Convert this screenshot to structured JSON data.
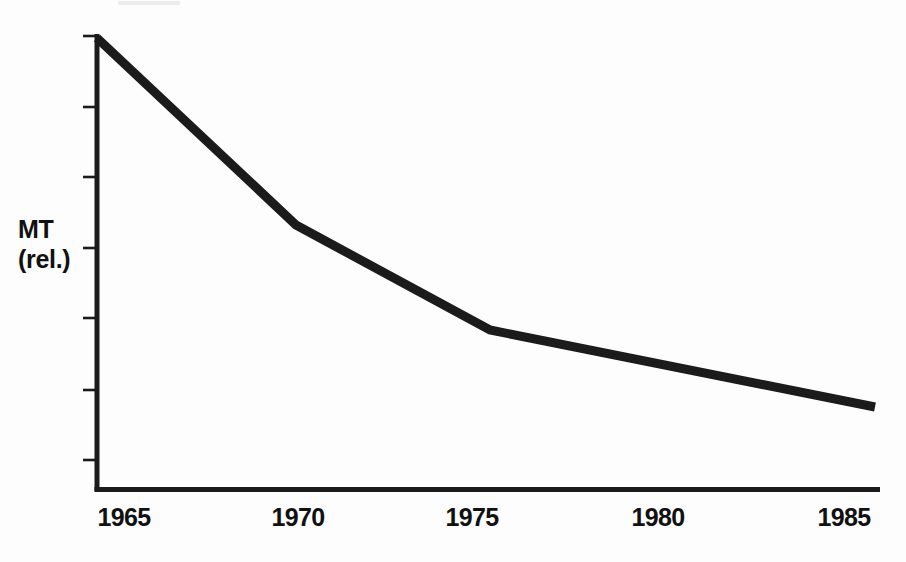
{
  "chart_data": {
    "type": "line",
    "title": "",
    "subtitle": "",
    "xlabel": "",
    "ylabel": "MT (rel.)",
    "ylabel_lines": [
      "MT",
      "(rel.)"
    ],
    "x": [
      1965,
      1970,
      1975,
      1985
    ],
    "values": [
      100,
      58,
      35,
      18
    ],
    "series": [
      {
        "name": "MT (rel.)",
        "x": [
          1965,
          1970,
          1975,
          1985
        ],
        "values": [
          100,
          58,
          35,
          18
        ]
      }
    ],
    "xtick_labels": [
      "1965",
      "1970",
      "1975",
      "1980",
      "1985"
    ],
    "xticks": [
      1965,
      1970,
      1975,
      1980,
      1985
    ],
    "xlim": [
      1964,
      1986
    ],
    "ylim": [
      0,
      100
    ],
    "ytick_labels": [
      "",
      "",
      "",
      "",
      "",
      "",
      ""
    ],
    "ytick_count": 7,
    "grid": false,
    "legend": false,
    "legend_position": "none",
    "line_color": "#1b1b1b",
    "axis_color": "#1b1b1b",
    "background_color": "#fdfdfd",
    "annotations": []
  },
  "geometry": {
    "axis_x": 97,
    "axis_top": 36,
    "axis_bottom": 490,
    "axis_right": 880,
    "ytick_y": [
      36,
      107,
      177,
      248,
      318,
      390,
      460
    ],
    "ytick_x_start": 83,
    "ytick_x_end": 97,
    "line_points": "97,38 296,225 490,330 875,407",
    "xtick_label_centers": [
      124,
      298,
      472,
      658,
      844
    ]
  }
}
